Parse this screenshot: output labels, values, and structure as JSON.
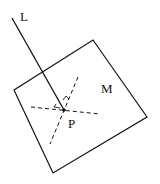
{
  "diagram": {
    "type": "geometry",
    "labels": {
      "line": "L",
      "plane": "M",
      "point": "P"
    },
    "colors": {
      "stroke": "#111111",
      "background": "#ffffff"
    },
    "plane_vertices": [
      [
        93,
        40
      ],
      [
        147,
        117
      ],
      [
        53,
        173
      ],
      [
        14,
        90
      ]
    ],
    "line_L": {
      "from": [
        12,
        18
      ],
      "to": [
        64,
        110
      ]
    },
    "point_P": [
      64,
      110
    ],
    "dashed_lines_in_plane": [
      {
        "from": [
          31,
          107
        ],
        "to": [
          100,
          114
        ]
      },
      {
        "from": [
          78,
          77
        ],
        "to": [
          50,
          144
        ]
      }
    ],
    "right_angle_markers": 2
  }
}
